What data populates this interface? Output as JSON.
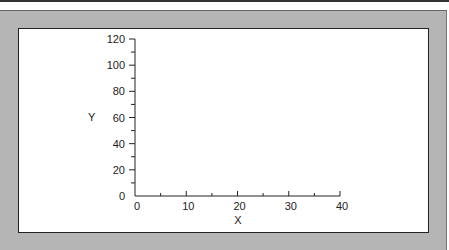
{
  "chart_data": {
    "type": "scatter",
    "title": "",
    "xlabel": "X",
    "ylabel": "Y",
    "xlim": [
      0,
      40
    ],
    "ylim": [
      0,
      120
    ],
    "x_ticks": [
      0,
      10,
      20,
      30,
      40
    ],
    "y_ticks": [
      0,
      20,
      40,
      60,
      80,
      100,
      120
    ],
    "x_minor_step": 5,
    "y_minor_step": 10,
    "grid": false,
    "series": [],
    "legend": null
  },
  "colors": {
    "panel_bg": "#b5b5b5",
    "plot_bg": "#ffffff",
    "axis": "#222222"
  }
}
